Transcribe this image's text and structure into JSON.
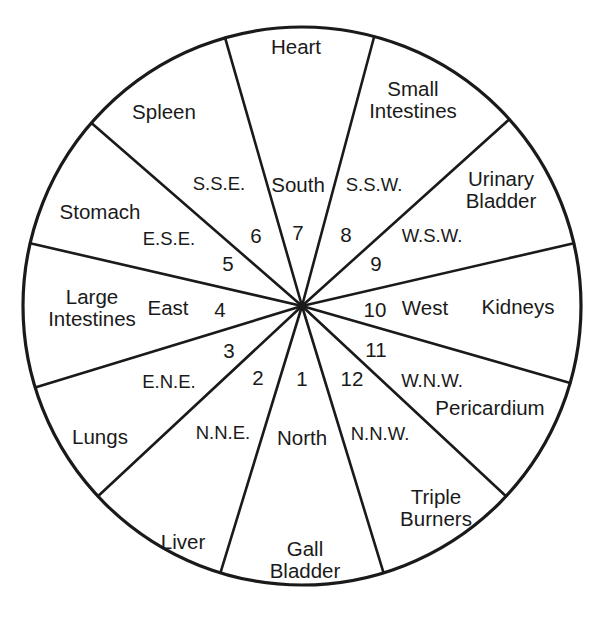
{
  "diagram": {
    "type": "radial-wheel",
    "sector_count": 12,
    "sector_degrees": 30,
    "geometry": {
      "center_x": 302,
      "center_y": 306,
      "radius": 279,
      "stroke_color": "#1a1a1a",
      "outline_width": 3.2,
      "divider_width": 2.6,
      "background": "#ffffff"
    },
    "organs": [
      {
        "name": "Heart",
        "text": "Heart",
        "x": 296,
        "y": 47,
        "sector": 7
      },
      {
        "name": "Small Intestines",
        "text": "Small\nIntestines",
        "x": 413,
        "y": 100,
        "sector": 8
      },
      {
        "name": "Urinary Bladder",
        "text": "Urinary\nBladder",
        "x": 501,
        "y": 190,
        "sector": 9
      },
      {
        "name": "Kidneys",
        "text": "Kidneys",
        "x": 518,
        "y": 307,
        "sector": 10
      },
      {
        "name": "Pericardium",
        "text": "Pericardium",
        "x": 490,
        "y": 408,
        "sector": 11
      },
      {
        "name": "Triple Burners",
        "text": "Triple\nBurners",
        "x": 436,
        "y": 508,
        "sector": 12
      },
      {
        "name": "Gall Bladder",
        "text": "Gall\nBladder",
        "x": 305,
        "y": 560,
        "sector": 1
      },
      {
        "name": "Liver",
        "text": "Liver",
        "x": 183,
        "y": 542,
        "sector": 2
      },
      {
        "name": "Lungs",
        "text": "Lungs",
        "x": 100,
        "y": 437,
        "sector": 3
      },
      {
        "name": "Large Intestines",
        "text": "Large\nIntestines",
        "x": 92,
        "y": 308,
        "sector": 4
      },
      {
        "name": "Stomach",
        "text": "Stomach",
        "x": 100,
        "y": 212,
        "sector": 5
      },
      {
        "name": "Spleen",
        "text": "Spleen",
        "x": 164,
        "y": 112,
        "sector": 6
      }
    ],
    "directions": [
      {
        "name": "South",
        "text": "South",
        "x": 298,
        "y": 185,
        "kind": "cardinal"
      },
      {
        "name": "S.S.W.",
        "text": "S.S.W.",
        "x": 374,
        "y": 185,
        "kind": "intercardinal"
      },
      {
        "name": "W.S.W.",
        "text": "W.S.W.",
        "x": 432,
        "y": 236,
        "kind": "intercardinal"
      },
      {
        "name": "West",
        "text": "West",
        "x": 425,
        "y": 308,
        "kind": "cardinal"
      },
      {
        "name": "W.N.W.",
        "text": "W.N.W.",
        "x": 432,
        "y": 381,
        "kind": "intercardinal"
      },
      {
        "name": "N.N.W.",
        "text": "N.N.W.",
        "x": 380,
        "y": 434,
        "kind": "intercardinal"
      },
      {
        "name": "North",
        "text": "North",
        "x": 302,
        "y": 438,
        "kind": "cardinal"
      },
      {
        "name": "N.N.E.",
        "text": "N.N.E.",
        "x": 223,
        "y": 433,
        "kind": "intercardinal"
      },
      {
        "name": "E.N.E.",
        "text": "E.N.E.",
        "x": 169,
        "y": 382,
        "kind": "intercardinal"
      },
      {
        "name": "East",
        "text": "East",
        "x": 168,
        "y": 308,
        "kind": "cardinal"
      },
      {
        "name": "E.S.E.",
        "text": "E.S.E.",
        "x": 169,
        "y": 239,
        "kind": "intercardinal"
      },
      {
        "name": "S.S.E.",
        "text": "S.S.E.",
        "x": 219,
        "y": 184,
        "kind": "intercardinal"
      }
    ],
    "numbers": [
      {
        "value": "1",
        "x": 302,
        "y": 379
      },
      {
        "value": "2",
        "x": 258,
        "y": 378
      },
      {
        "value": "3",
        "x": 229,
        "y": 351
      },
      {
        "value": "4",
        "x": 220,
        "y": 310
      },
      {
        "value": "5",
        "x": 228,
        "y": 264
      },
      {
        "value": "6",
        "x": 256,
        "y": 236
      },
      {
        "value": "7",
        "x": 298,
        "y": 233
      },
      {
        "value": "8",
        "x": 346,
        "y": 235
      },
      {
        "value": "9",
        "x": 376,
        "y": 264
      },
      {
        "value": "10",
        "x": 375,
        "y": 310
      },
      {
        "value": "11",
        "x": 376,
        "y": 350
      },
      {
        "value": "12",
        "x": 352,
        "y": 379
      }
    ],
    "dividers": [
      {
        "name": "heart-smallintestines",
        "angle_deg": 75
      },
      {
        "name": "smallintestines-urinarybladder",
        "angle_deg": 42
      },
      {
        "name": "urinarybladder-kidneys",
        "angle_deg": 13
      },
      {
        "name": "kidneys-pericardium",
        "angle_deg": -16
      },
      {
        "name": "pericardium-tripleburners",
        "angle_deg": -43
      },
      {
        "name": "tripleburners-gallbladder",
        "angle_deg": -73
      },
      {
        "name": "gallbladder-liver",
        "angle_deg": -107
      },
      {
        "name": "liver-lungs",
        "angle_deg": -137
      },
      {
        "name": "lungs-largeintestines",
        "angle_deg": -163
      },
      {
        "name": "largeintestines-stomach",
        "angle_deg": 167
      },
      {
        "name": "stomach-spleen",
        "angle_deg": 139
      },
      {
        "name": "spleen-heart",
        "angle_deg": 106
      }
    ]
  }
}
